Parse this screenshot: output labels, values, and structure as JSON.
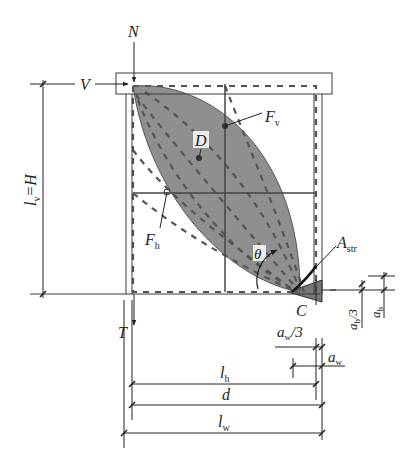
{
  "diagram": {
    "type": "strut-and-tie model of a shear wall / column panel",
    "colors": {
      "line": "#3a3a3a",
      "fill": "#8f8f8f",
      "dash": "#555555",
      "background": "#ffffff"
    },
    "forces": {
      "axial": "N",
      "shear": "V",
      "tension": "T",
      "compression_node": "C"
    },
    "labels": {
      "D": "D",
      "Fv_main": "F",
      "Fv_sub": "v",
      "Fh_main": "F",
      "Fh_sub": "h",
      "theta": "θ",
      "Astr_main": "A",
      "Astr_sub": "str"
    },
    "dimensions": {
      "height_left": {
        "main": "l",
        "sub": "v",
        "rest": "=H"
      },
      "ab_third": {
        "main": "a",
        "sub": "b",
        "rest": "/3"
      },
      "ab": {
        "main": "a",
        "sub": "b"
      },
      "aw_third": {
        "main": "a",
        "sub": "w",
        "rest": "/3"
      },
      "aw": {
        "main": "a",
        "sub": "w"
      },
      "lh": {
        "main": "l",
        "sub": "h"
      },
      "d": {
        "main": "d"
      },
      "lw": {
        "main": "l",
        "sub": "w"
      }
    }
  }
}
